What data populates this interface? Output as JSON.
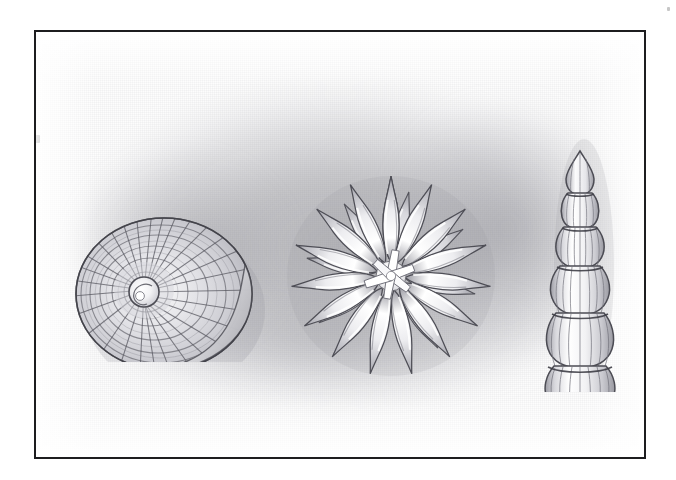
{
  "artwork": {
    "medium": "graphite pencil on textured paper",
    "style": "scientific specimen illustration plate",
    "plate_background": "#fdfdfd",
    "paper_background": "#ffffff",
    "frame_color": "#1d1d1f",
    "shading_color": "#8e8e94",
    "frame": {
      "x": 34,
      "y": 30,
      "width": 612,
      "height": 429,
      "border_width": 2
    },
    "specimen_count": 3
  },
  "specimens": [
    {
      "id": "shell",
      "name": "coiled spiral shell",
      "description": "planispiral gastropod-like shell drawn in lateral view with radial ribs and concentric growth lines converging on a bright nucleus",
      "position": "left",
      "ribs": 34,
      "growth_rings": 7,
      "whorls": 3,
      "center_x": 128,
      "center_y": 262,
      "outline_stroke": "#4a4a50",
      "fill_light": "#e9e9ec",
      "fill_shadow": "#b2b2b8"
    },
    {
      "id": "star",
      "name": "radiate star rosette",
      "description": "star-shaped specimen with spindle-shaped rays radiating from a bright multi-armed white core, two overlapping tiers of rays",
      "position": "center",
      "rays_outer": 15,
      "rays_inner": 8,
      "core_arms": 6,
      "center_x": 355,
      "center_y": 245,
      "outline_stroke": "#4a4a50",
      "fill_light": "#f0f0f2",
      "fill_shadow": "#a9a9b0"
    },
    {
      "id": "nodosaria",
      "name": "segmented ribbed test",
      "description": "uniserial chambered foraminifera test, six inflated chambers increasing in size downward, each covered with longitudinal ribs; pointed apex above and short tubular neck below",
      "position": "right",
      "chambers": 6,
      "ribs_per_chamber": 9,
      "center_x": 546,
      "top_y": 120,
      "bottom_y": 352,
      "outline_stroke": "#4a4a50",
      "fill_light": "#eeeef0",
      "fill_shadow": "#a6a6ad"
    }
  ],
  "marks": [
    {
      "id": "left-rule-tick",
      "description": "small dark blob on the left frame rule",
      "x": 33,
      "y": 135
    },
    {
      "id": "paper-speck-top-right",
      "description": "faint speck on the paper above the frame",
      "x": 668,
      "y": 8
    }
  ]
}
